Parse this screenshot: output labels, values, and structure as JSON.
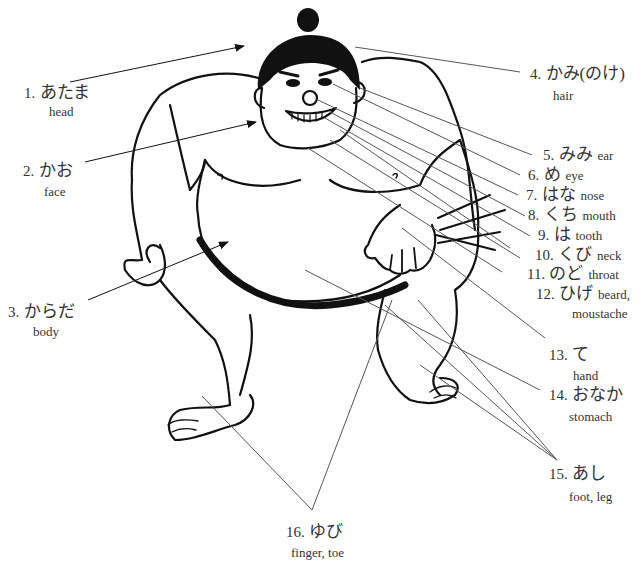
{
  "diagram": {
    "labels": [
      {
        "id": 1,
        "num": "1.",
        "jp": "あたま",
        "en": "head"
      },
      {
        "id": 2,
        "num": "2.",
        "jp": "かお",
        "en": "face"
      },
      {
        "id": 3,
        "num": "3.",
        "jp": "からだ",
        "en": "body"
      },
      {
        "id": 4,
        "num": "4.",
        "jp": "かみ(のけ)",
        "en": "hair"
      },
      {
        "id": 5,
        "num": "5.",
        "jp": "みみ",
        "en": "ear"
      },
      {
        "id": 6,
        "num": "6.",
        "jp": "め",
        "en": "eye"
      },
      {
        "id": 7,
        "num": "7.",
        "jp": "はな",
        "en": "nose"
      },
      {
        "id": 8,
        "num": "8.",
        "jp": "くち",
        "en": "mouth"
      },
      {
        "id": 9,
        "num": "9.",
        "jp": "は",
        "en": "tooth"
      },
      {
        "id": 10,
        "num": "10.",
        "jp": "くび",
        "en": "neck"
      },
      {
        "id": 11,
        "num": "11.",
        "jp": "のど",
        "en": "throat"
      },
      {
        "id": 12,
        "num": "12.",
        "jp": "ひげ",
        "en": "beard,",
        "en2": "moustache"
      },
      {
        "id": 13,
        "num": "13.",
        "jp": "て",
        "en": "hand"
      },
      {
        "id": 14,
        "num": "14.",
        "jp": "おなか",
        "en": "stomach"
      },
      {
        "id": 15,
        "num": "15.",
        "jp": "あし",
        "en": "foot, leg"
      },
      {
        "id": 16,
        "num": "16.",
        "jp": "ゆび",
        "en": "finger, toe"
      }
    ],
    "colors": {
      "ink": "#111111",
      "leader": "#555555",
      "text": "#333333",
      "background": "#ffffff"
    }
  }
}
